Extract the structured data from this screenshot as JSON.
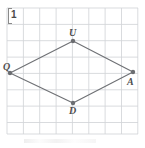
{
  "figure": {
    "exercise_number": "1",
    "width": 145,
    "height": 148,
    "background_color": "#ffffff"
  },
  "grid": {
    "line_color": "#d2d4d8",
    "spacing_px": 16.35,
    "x_start": 7,
    "x_end": 138,
    "y_start": 8,
    "y_end": 134,
    "vertical_lines": [
      7,
      23.4,
      39.7,
      56.1,
      72.4,
      88.8,
      105.1,
      121.5,
      137.8
    ],
    "horizontal_lines": [
      8,
      24.4,
      40.7,
      57.1,
      73.4,
      89.8,
      106.1,
      122.5,
      134
    ]
  },
  "shape": {
    "name": "rhombus-quad",
    "stroke_color": "#6f7175",
    "vertex_color": "#6b6d71",
    "vertices": [
      {
        "label": "Q",
        "x": 10,
        "y": 73,
        "label_x": 3,
        "label_y": 62
      },
      {
        "label": "U",
        "x": 73,
        "y": 41,
        "label_x": 69,
        "label_y": 28
      },
      {
        "label": "A",
        "x": 133,
        "y": 72,
        "label_x": 127,
        "label_y": 77
      },
      {
        "label": "D",
        "x": 73,
        "y": 103,
        "label_x": 69,
        "label_y": 106
      }
    ]
  }
}
